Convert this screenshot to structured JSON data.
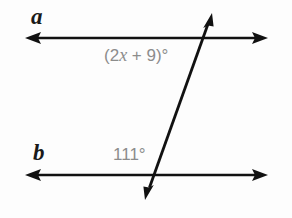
{
  "figure": {
    "background_color": "#fdfdfd",
    "width": 292,
    "height": 218
  },
  "lines": [
    {
      "name": "line-a",
      "label": "a",
      "label_color": "#1a1a1a",
      "stroke_color": "#111111",
      "y": 38,
      "x_start": 25,
      "x_end": 268,
      "arrows": "both"
    },
    {
      "name": "line-b",
      "label": "b",
      "label_color": "#1a1a1a",
      "stroke_color": "#111111",
      "y": 175,
      "x_start": 25,
      "x_end": 268,
      "arrows": "both"
    }
  ],
  "transversal": {
    "name": "transversal",
    "stroke_color": "#111111",
    "x_top": 212,
    "y_top": 13,
    "x_bottom": 145,
    "y_bottom": 200,
    "arrows": "both"
  },
  "angles": [
    {
      "name": "angle-top",
      "expression_prefix": "(2",
      "variable": "x",
      "expression_suffix": " + 9)°",
      "full_text": "(2x + 9)°",
      "color": "#8c8c8c",
      "on_line": "a"
    },
    {
      "name": "angle-bottom",
      "value": "111°",
      "color": "#8c8c8c",
      "on_line": "b"
    }
  ]
}
